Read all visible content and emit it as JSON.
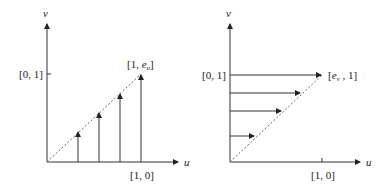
{
  "figures": [
    {
      "name": "left",
      "axes": {
        "x_label": "u",
        "y_label": "v"
      },
      "ticks": {
        "y_tick": "[0, 1]",
        "x_tick": "[1, 0]"
      },
      "endpoint_label": {
        "open": "[1, ",
        "var": "e",
        "sub": "u",
        "close": "]"
      },
      "arrows": "vertical",
      "arrow_count": 4
    },
    {
      "name": "right",
      "axes": {
        "x_label": "u",
        "y_label": "v"
      },
      "ticks": {
        "y_tick": "[0, 1]",
        "x_tick": "[1, 0]"
      },
      "endpoint_label": {
        "open": "[",
        "var": "e",
        "sub": "v",
        "close": " , 1]"
      },
      "arrows": "horizontal",
      "arrow_count": 4
    }
  ],
  "colors": {
    "line": "#333333",
    "dashed": "#666666"
  }
}
